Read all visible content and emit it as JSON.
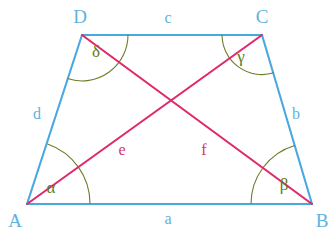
{
  "figure": {
    "kind": "geometry-diagram",
    "shape": "trapezoid-with-diagonals",
    "colors": {
      "sides": "#4aa8e0",
      "diagonals": "#e0286a",
      "arcs": "#6b7d28",
      "vertex_text": "#5fb3e0",
      "side_text": "#5fb3e0",
      "diagonal_text": "#d6336c",
      "angle_text": "#5a7a20",
      "background": "#ffffff"
    },
    "vertices": [
      {
        "name": "A",
        "label": "A",
        "x": 27,
        "y": 204,
        "label_x": 15,
        "label_y": 220
      },
      {
        "name": "B",
        "label": "B",
        "x": 312,
        "y": 204,
        "label_x": 322,
        "label_y": 220
      },
      {
        "name": "C",
        "label": "C",
        "x": 262,
        "y": 35,
        "label_x": 262,
        "label_y": 16
      },
      {
        "name": "D",
        "label": "D",
        "x": 82,
        "y": 35,
        "label_x": 80,
        "label_y": 16
      }
    ],
    "sides": [
      {
        "name": "a",
        "label": "a",
        "from": "A",
        "to": "B",
        "label_x": 168,
        "label_y": 219
      },
      {
        "name": "b",
        "label": "b",
        "from": "B",
        "to": "C",
        "label_x": 296,
        "label_y": 114
      },
      {
        "name": "c",
        "label": "c",
        "from": "C",
        "to": "D",
        "label_x": 168,
        "label_y": 18
      },
      {
        "name": "d",
        "label": "d",
        "from": "D",
        "to": "A",
        "label_x": 37,
        "label_y": 114
      }
    ],
    "diagonals": [
      {
        "name": "e",
        "label": "e",
        "from": "A",
        "to": "C",
        "label_x": 122,
        "label_y": 150
      },
      {
        "name": "f",
        "label": "f",
        "from": "D",
        "to": "B",
        "label_x": 204,
        "label_y": 150
      }
    ],
    "diagonal_intersection": {
      "x": 168,
      "y": 103
    },
    "angles": [
      {
        "name": "alpha",
        "label": "α",
        "at": "A",
        "label_x": 51,
        "label_y": 187
      },
      {
        "name": "beta",
        "label": "β",
        "at": "B",
        "label_x": 284,
        "label_y": 184
      },
      {
        "name": "gamma",
        "label": "γ",
        "at": "C",
        "label_x": 241,
        "label_y": 56
      },
      {
        "name": "delta",
        "label": "δ",
        "at": "D",
        "label_x": 96,
        "label_y": 51
      }
    ]
  }
}
